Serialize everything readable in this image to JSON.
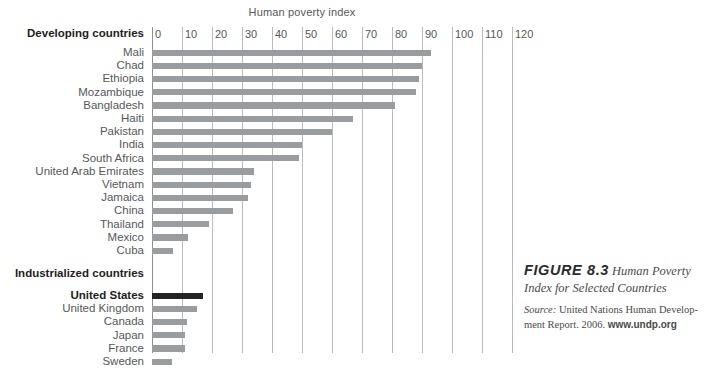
{
  "chart_data": {
    "type": "bar",
    "orientation": "horizontal",
    "title": "Human poverty index",
    "xlabel": "Human poverty index",
    "ylabel": "",
    "xlim": [
      0,
      120
    ],
    "xticks": [
      0,
      10,
      20,
      30,
      40,
      50,
      60,
      70,
      80,
      90,
      100,
      110,
      120
    ],
    "grid": true,
    "legend": "none",
    "groups": [
      {
        "name": "Developing countries",
        "categories": [
          "Mali",
          "Chad",
          "Ethiopia",
          "Mozambique",
          "Bangladesh",
          "Haiti",
          "Pakistan",
          "India",
          "South Africa",
          "United Arab Emirates",
          "Vietnam",
          "Jamaica",
          "China",
          "Thailand",
          "Mexico",
          "Cuba"
        ],
        "values": [
          93,
          90,
          89,
          88,
          81,
          67,
          60,
          50,
          49,
          34,
          33,
          32,
          27,
          19,
          12,
          7
        ],
        "color": "#9a9da0"
      },
      {
        "name": "Industrialized countries",
        "categories": [
          "United States",
          "United Kingdom",
          "Canada",
          "Japan",
          "France",
          "Sweden"
        ],
        "values": [
          17,
          15,
          11.5,
          11,
          11,
          6.5
        ],
        "color": "#9a9da0",
        "highlight": {
          "category": "United States",
          "color": "#232323"
        }
      }
    ]
  },
  "axis": {
    "title": "Human poverty index",
    "tick_labels": [
      "0",
      "10",
      "20",
      "30",
      "40",
      "50",
      "60",
      "70",
      "80",
      "90",
      "100",
      "110",
      "120"
    ]
  },
  "groups": {
    "developing_label": "Developing countries",
    "industrialized_label": "Industrialized countries"
  },
  "caption": {
    "figure_number": "FIGURE 8.3",
    "title_line1": "Human Poverty",
    "title_line2": "Index for Selected Countries",
    "source_label": "Source:",
    "source_text": "United Nations Human Develop-",
    "source_text2": "ment Report. 2006.",
    "url": "www.undp.org"
  },
  "colors": {
    "bar": "#9a9da0",
    "bar_highlight": "#232323",
    "gridline": "#b9bcbe",
    "text": "#55585a"
  }
}
